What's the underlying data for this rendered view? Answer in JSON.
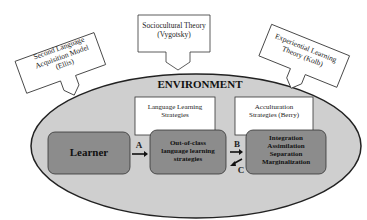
{
  "diagram": {
    "environment_label": "ENVIRONMENT",
    "theories": [
      {
        "line1": "Second Language",
        "line2": "Acquisition Model",
        "line3": "(Ellis)"
      },
      {
        "line1": "Sociocultural Theory",
        "line2": "(Vygotsky)"
      },
      {
        "line1": "Experiential Learning",
        "line2": "Theory (Kolb)"
      }
    ],
    "strategy_boxes": [
      {
        "line1": "Language Learning",
        "line2": "Strategies"
      },
      {
        "line1": "Acculturation",
        "line2": "Strategies (Berry)"
      }
    ],
    "nodes": {
      "learner": "Learner",
      "out_of_class": {
        "line1": "Out-of-class",
        "line2": "language learning",
        "line3": "strategies"
      },
      "acculturation": {
        "items": [
          "Integration",
          "Assimilation",
          "Separation",
          "Marginalization"
        ]
      }
    },
    "arrows": {
      "a": "A",
      "b": "B",
      "c": "C"
    },
    "colors": {
      "environment_fill": "#cfcfcf",
      "node_fill": "#8c8c8c",
      "box_fill": "#ffffff",
      "stroke": "#222222"
    }
  }
}
